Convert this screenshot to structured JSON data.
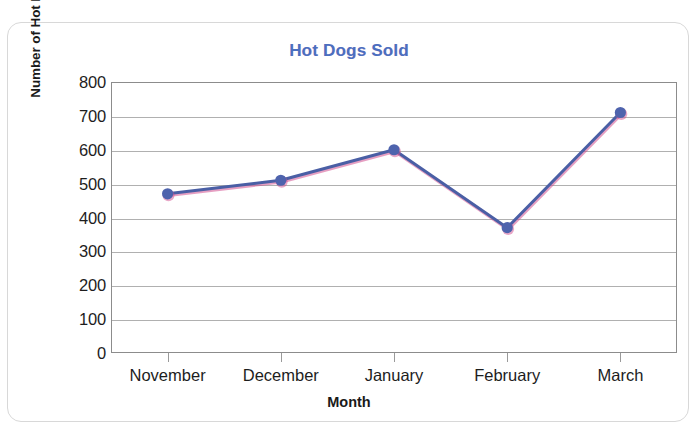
{
  "chart_data": {
    "type": "line",
    "title": "Hot Dogs Sold",
    "xlabel": "Month",
    "ylabel": "Number of Hot Dogs",
    "categories": [
      "November",
      "December",
      "January",
      "February",
      "March"
    ],
    "values": [
      470,
      510,
      600,
      370,
      710
    ],
    "series": [
      {
        "name": "Hot Dogs Sold",
        "values": [
          470,
          510,
          600,
          370,
          710
        ]
      }
    ],
    "ylim": [
      0,
      800
    ],
    "y_ticks": [
      0,
      100,
      200,
      300,
      400,
      500,
      600,
      700,
      800
    ],
    "y_tick_labels": [
      "0",
      "100",
      "200",
      "300",
      "400",
      "500",
      "600",
      "700",
      "800"
    ],
    "grid": true,
    "legend": false,
    "legend_position": "none",
    "colors": {
      "title": "#4a6fc0",
      "line": "#4a5fa5",
      "line_shadow": "#d1508f",
      "marker": "#4e63ad",
      "grid": "#b0b0b0",
      "axis": "#8c8c8c",
      "text": "#1d1d1d",
      "card_border": "#d8d8d8",
      "background": "#ffffff"
    }
  }
}
